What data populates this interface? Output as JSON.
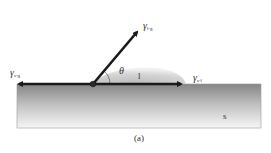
{
  "diagram": {
    "labels": {
      "gamma_sg": {
        "symbol": "γ",
        "subscript": "s-g"
      },
      "gamma_lg": {
        "symbol": "γ",
        "subscript": "l-g"
      },
      "gamma_sl": {
        "symbol": "γ",
        "subscript": "s-l"
      },
      "theta": "θ",
      "liquid": "l",
      "solid": "s"
    },
    "caption": "(a)",
    "colors": {
      "arrow": "#1a1a1a",
      "substrate_top": "#8a8a8a",
      "substrate_bottom": "#f4f4f4",
      "droplet": "#c8c8c8"
    }
  }
}
